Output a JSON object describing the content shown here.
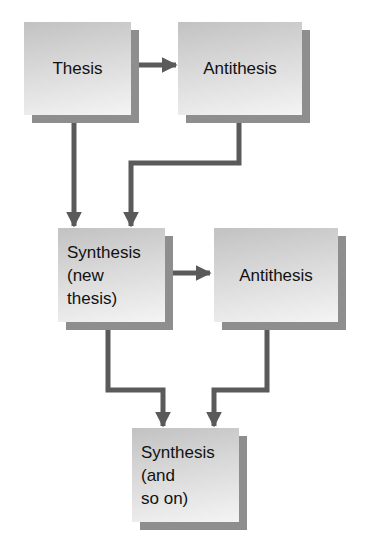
{
  "diagram": {
    "colors": {
      "arrow": "#5a5a5a",
      "box_top": "#c2c2c2",
      "box_bottom": "#f4f4f4",
      "shadow": "#8e8e8e",
      "text": "#111111"
    },
    "nodes": [
      {
        "id": "thesis",
        "lines": [
          "Thesis"
        ]
      },
      {
        "id": "antithesis-1",
        "lines": [
          "Antithesis"
        ]
      },
      {
        "id": "synthesis-1",
        "lines": [
          "Synthesis",
          "(new",
          "thesis)"
        ]
      },
      {
        "id": "antithesis-2",
        "lines": [
          "Antithesis"
        ]
      },
      {
        "id": "synthesis-2",
        "lines": [
          "Synthesis",
          "(and",
          "so on)"
        ]
      }
    ],
    "edges": [
      {
        "from": "thesis",
        "to": "antithesis-1"
      },
      {
        "from": "thesis",
        "to": "synthesis-1"
      },
      {
        "from": "antithesis-1",
        "to": "synthesis-1"
      },
      {
        "from": "synthesis-1",
        "to": "antithesis-2"
      },
      {
        "from": "synthesis-1",
        "to": "synthesis-2"
      },
      {
        "from": "antithesis-2",
        "to": "synthesis-2"
      }
    ]
  }
}
